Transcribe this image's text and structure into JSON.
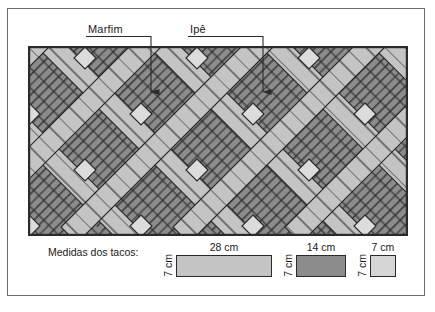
{
  "figure": {
    "callouts": [
      {
        "id": "marfim",
        "label": "Marfim"
      },
      {
        "id": "ipe",
        "label": "Ipê"
      }
    ],
    "legend": {
      "title": "Medidas dos tacos:",
      "items": [
        {
          "id": "taco-28",
          "length_label": "28 cm",
          "width_label": "7 cm",
          "color": "#c4c4c4"
        },
        {
          "id": "taco-14",
          "length_label": "14 cm",
          "width_label": "7 cm",
          "color": "#8c8c8c"
        },
        {
          "id": "taco-7",
          "length_label": "7 cm",
          "width_label": "7 cm",
          "color": "#d6d6d6"
        }
      ]
    },
    "colors": {
      "ipe_dark_gray": "#8c8c8c",
      "marfim_light_gray": "#c4c4c4",
      "marfim_pale_gray": "#d6d6d6",
      "tile_outline": "#2b2b2b",
      "frame_border": "#6b6b6b",
      "background": "#ffffff",
      "text": "#1a1a1a"
    }
  }
}
